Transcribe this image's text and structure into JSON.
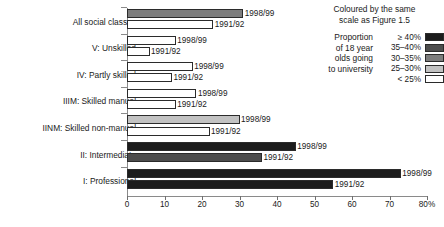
{
  "chart_data": {
    "type": "bar",
    "orientation": "horizontal",
    "title": "",
    "xlabel": "",
    "ylabel": "",
    "xlim": [
      0,
      80
    ],
    "xticks": [
      0,
      10,
      20,
      30,
      40,
      50,
      60,
      70,
      80
    ],
    "xticklabels": [
      "0",
      "10",
      "20",
      "30",
      "40",
      "50",
      "60",
      "70",
      "80%"
    ],
    "grid": false,
    "categories": [
      "All social classes",
      "V: Unskilled",
      "IV: Partly skilled",
      "IIIM: Skilled manual",
      "IINM: Skilled non-manual",
      "II: Intermediate",
      "I: Professional"
    ],
    "series": [
      {
        "name": "1998/99",
        "values": [
          31,
          13,
          17.5,
          18.5,
          30,
          45,
          73
        ]
      },
      {
        "name": "1991/92",
        "values": [
          23,
          6,
          12,
          13,
          22,
          36,
          55
        ]
      }
    ],
    "bar_fill_bands": [
      [
        "30-35%",
        "<25%"
      ],
      [
        "<25%",
        "<25%"
      ],
      [
        "<25%",
        "<25%"
      ],
      [
        "<25%",
        "<25%"
      ],
      [
        "25-30%",
        "<25%"
      ],
      [
        ">=40%",
        "35-40%"
      ],
      [
        ">=40%",
        ">=40%"
      ]
    ],
    "bar_labels": [
      [
        "1998/99",
        "1991/92"
      ],
      [
        "1998/99",
        "1991/92"
      ],
      [
        "1998/99",
        "1991/92"
      ],
      [
        "1998/99",
        "1991/92"
      ],
      [
        "1998/99",
        "1991/92"
      ],
      [
        "1998/99",
        "1991/92"
      ],
      [
        "1998/99",
        "1991/92"
      ]
    ]
  },
  "legend": {
    "title_line1": "Coloured by the same",
    "title_line2": "scale as Figure 1.5",
    "description_lines": [
      "Proportion",
      "of 18 year",
      "olds going",
      "to university"
    ],
    "rows": [
      {
        "range": "≥ 40%",
        "key": ">=40%",
        "color": "#1c1c1c"
      },
      {
        "range": "35–40%",
        "key": "35-40%",
        "color": "#4d4d4d"
      },
      {
        "range": "30–35%",
        "key": "30-35%",
        "color": "#7d7d7d"
      },
      {
        "range": "25–30%",
        "key": "25-30%",
        "color": "#c2c2c2"
      },
      {
        "range": "< 25%",
        "key": "<25%",
        "color": "#ffffff"
      }
    ]
  }
}
